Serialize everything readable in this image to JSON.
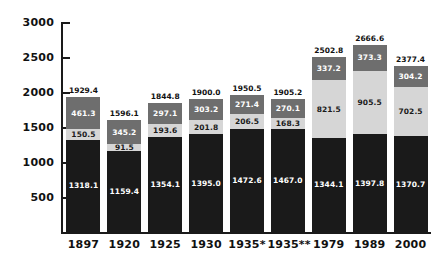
{
  "chart_data": {
    "type": "bar",
    "subtype": "stacked-vertical",
    "title": "",
    "xlabel": "",
    "ylabel": "",
    "ylim": [
      0,
      3000
    ],
    "ytick_step": 500,
    "yticks": [
      "500",
      "1000",
      "1500",
      "2000",
      "2500",
      "3000"
    ],
    "grid": false,
    "legend": "none",
    "categories": [
      "1897",
      "1920",
      "1925",
      "1930",
      "1935*",
      "1935**",
      "1979",
      "1989",
      "2000"
    ],
    "series": [
      {
        "name": "bottom-segment",
        "color": "#1a1a1a",
        "values": [
          1318.1,
          1159.4,
          1354.1,
          1395.0,
          1472.6,
          1467.0,
          1344.1,
          1397.8,
          1370.7
        ]
      },
      {
        "name": "middle-segment",
        "color": "#d6d6d6",
        "values": [
          150.5,
          91.5,
          193.6,
          201.8,
          206.5,
          168.3,
          821.5,
          905.5,
          702.5
        ]
      },
      {
        "name": "top-segment",
        "color": "#6e6e6e",
        "values": [
          461.3,
          345.2,
          297.1,
          303.2,
          271.4,
          270.1,
          337.2,
          373.3,
          304.2
        ]
      }
    ],
    "totals": [
      1929.4,
      1596.1,
      1844.8,
      1900.0,
      1950.5,
      1905.2,
      2502.8,
      2666.6,
      2377.4
    ],
    "value_labels": {
      "totals": [
        "1929.4",
        "1596.1",
        "1844.8",
        "1900.0",
        "1950.5",
        "1905.2",
        "2502.8",
        "2666.6",
        "2377.4"
      ],
      "top": [
        "461.3",
        "345.2",
        "297.1",
        "303.2",
        "271.4",
        "270.1",
        "337.2",
        "373.3",
        "304.2"
      ],
      "middle": [
        "150.5",
        "91.5",
        "193.6",
        "201.8",
        "206.5",
        "168.3",
        "821.5",
        "905.5",
        "702.5"
      ],
      "bottom": [
        "1318.1",
        "1159.4",
        "1354.1",
        "1395.0",
        "1472.6",
        "1467.0",
        "1344.1",
        "1397.8",
        "1370.7"
      ]
    },
    "colors": {
      "top": "#6e6e6e",
      "middle": "#d6d6d6",
      "bottom": "#1a1a1a",
      "axis": "#1a1a1a",
      "background": "#ffffff"
    }
  }
}
